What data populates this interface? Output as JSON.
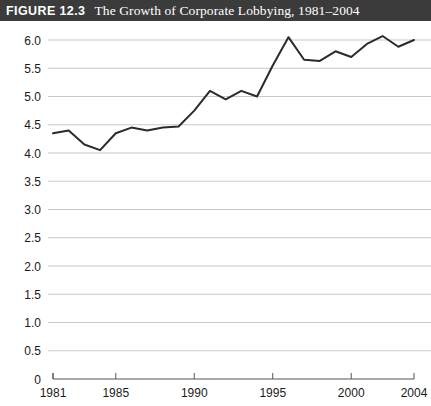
{
  "header": {
    "figure_label": "FIGURE 12.3",
    "title": "The Growth of Corporate Lobbying, 1981–2004",
    "background_color": "#3b3b3b",
    "text_color": "#ffffff"
  },
  "chart_data": {
    "type": "line",
    "title": "The Growth of Corporate Lobbying, 1981–2004",
    "xlabel": "",
    "ylabel": "",
    "x": [
      1981,
      1982,
      1983,
      1984,
      1985,
      1986,
      1987,
      1988,
      1989,
      1990,
      1991,
      1992,
      1993,
      1994,
      1995,
      1996,
      1997,
      1998,
      1999,
      2000,
      2001,
      2002,
      2003,
      2004
    ],
    "values": [
      4.35,
      4.4,
      4.15,
      4.05,
      4.35,
      4.45,
      4.4,
      4.45,
      4.47,
      4.75,
      5.1,
      4.95,
      5.1,
      5.0,
      5.55,
      6.05,
      5.65,
      5.63,
      5.8,
      5.7,
      5.93,
      6.07,
      5.88,
      6.0
    ],
    "series": [
      {
        "name": "Corporate Lobbying",
        "values": [
          4.35,
          4.4,
          4.15,
          4.05,
          4.35,
          4.45,
          4.4,
          4.45,
          4.47,
          4.75,
          5.1,
          4.95,
          5.1,
          5.0,
          5.55,
          6.05,
          5.65,
          5.63,
          5.8,
          5.7,
          5.93,
          6.07,
          5.88,
          6.0
        ],
        "color": "#2b2b2b"
      }
    ],
    "xlim": [
      1981,
      2004
    ],
    "ylim": [
      0,
      6.0
    ],
    "ytick_labels": [
      "6.0",
      "5.5",
      "5.0",
      "4.5",
      "4.0",
      "3.5",
      "3.0",
      "2.5",
      "2.0",
      "1.5",
      "1.0",
      "0.5",
      "0"
    ],
    "ytick_values": [
      6.0,
      5.5,
      5.0,
      4.5,
      4.0,
      3.5,
      3.0,
      2.5,
      2.0,
      1.5,
      1.0,
      0.5,
      0
    ],
    "xtick_labels": [
      "1981",
      "1985",
      "1990",
      "1995",
      "2000",
      "2004"
    ],
    "xtick_values": [
      1981,
      1985,
      1990,
      1995,
      2000,
      2004
    ],
    "grid": "horizontal",
    "legend": "none",
    "grid_color": "#c9c9c9",
    "axis_color": "#555555"
  }
}
